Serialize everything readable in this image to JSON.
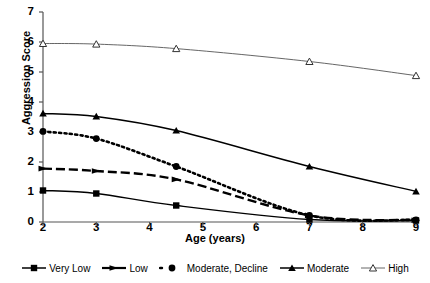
{
  "chart_data": {
    "type": "line",
    "title": "",
    "xlabel": "Age (years)",
    "ylabel": "Aggression Score",
    "x": [
      2,
      3,
      4.5,
      7,
      9
    ],
    "xlim": [
      2,
      9
    ],
    "ylim": [
      0,
      7
    ],
    "xticks": [
      "2",
      "3",
      "4",
      "5",
      "6",
      "7",
      "8",
      "9"
    ],
    "yticks": [
      "0",
      "1",
      "2",
      "3",
      "4",
      "5",
      "6",
      "7"
    ],
    "grid": false,
    "legend_position": "bottom",
    "series": [
      {
        "name": "Very Low",
        "marker": "square-filled",
        "line": "solid",
        "color": "#000000",
        "values": [
          1.05,
          0.95,
          0.55,
          0.08,
          0.05
        ]
      },
      {
        "name": "Low",
        "marker": "arrow",
        "line": "dashed",
        "color": "#000000",
        "values": [
          1.78,
          1.7,
          1.42,
          0.22,
          0.06
        ]
      },
      {
        "name": "Moderate, Decline",
        "marker": "circle-filled",
        "line": "dotted",
        "color": "#000000",
        "values": [
          3.02,
          2.78,
          1.85,
          0.22,
          0.07
        ]
      },
      {
        "name": "Moderate",
        "marker": "triangle-filled",
        "line": "solid",
        "color": "#000000",
        "values": [
          3.62,
          3.52,
          3.05,
          1.85,
          1.02
        ]
      },
      {
        "name": "High",
        "marker": "triangle-open",
        "line": "solid",
        "color": "#555555",
        "values": [
          5.95,
          5.93,
          5.78,
          5.35,
          4.88
        ]
      }
    ]
  },
  "axes": {
    "y_title": "Aggression Score",
    "x_title": "Age (years)"
  },
  "legend": {
    "items": [
      {
        "label": "Very Low"
      },
      {
        "label": "Low"
      },
      {
        "label": "Moderate, Decline"
      },
      {
        "label": "Moderate"
      },
      {
        "label": "High"
      }
    ]
  }
}
